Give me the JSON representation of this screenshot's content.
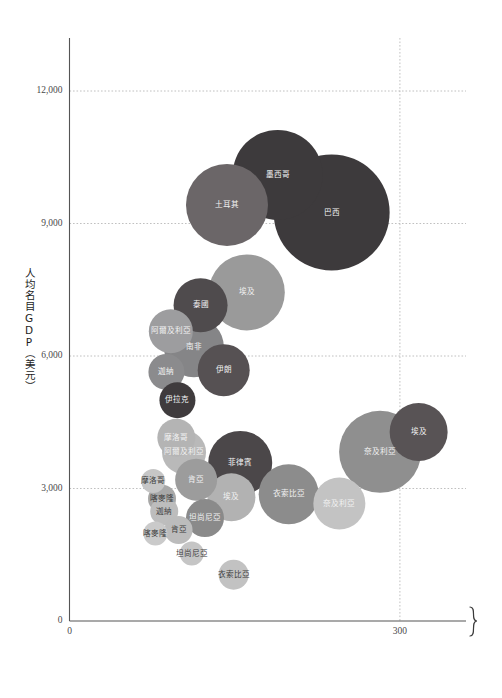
{
  "chart_data": {
    "type": "scatter",
    "title": "",
    "subtitle": "",
    "xlabel": "",
    "ylabel": "人均名目GDP（美元）",
    "xlim": [
      0,
      360
    ],
    "ylim": [
      0,
      13200
    ],
    "xticks": [
      0,
      300
    ],
    "xtick_labels": [
      "0",
      "300"
    ],
    "yticks": [
      0,
      3000,
      6000,
      9000,
      12000
    ],
    "ytick_labels": [
      "0",
      "3,000",
      "6,000",
      "9,000",
      "12,000"
    ],
    "grid": "dotted horizontal and vertical gridlines",
    "legend": "none",
    "axis_break": "curly brace on right end of x-axis indicating truncated axis",
    "bubble_size_meaning": "bubble area encodes a third variable (population / market size)",
    "points": [
      {
        "label": "巴西",
        "x": 238,
        "y": 9250,
        "r": 58,
        "color": "#3d3a3c",
        "text_color": "light"
      },
      {
        "label": "墨西哥",
        "x": 189,
        "y": 10100,
        "r": 45,
        "color": "#3d3a3c",
        "text_color": "light"
      },
      {
        "label": "土耳其",
        "x": 143,
        "y": 9420,
        "r": 41,
        "color": "#6b6668",
        "text_color": "light"
      },
      {
        "label": "埃及",
        "x": 161,
        "y": 7440,
        "r": 38,
        "color": "#9a9a9a",
        "text_color": "light"
      },
      {
        "label": "泰國",
        "x": 119,
        "y": 7150,
        "r": 27,
        "color": "#4f4b4d",
        "text_color": "light"
      },
      {
        "label": "南非",
        "x": 113,
        "y": 6200,
        "r": 30,
        "color": "#858587",
        "text_color": "light"
      },
      {
        "label": "阿爾及利亞",
        "x": 92,
        "y": 6560,
        "r": 22,
        "color": "#9d9d9f",
        "text_color": "light"
      },
      {
        "label": "伊朗",
        "x": 140,
        "y": 5680,
        "r": 26,
        "color": "#565153",
        "text_color": "light"
      },
      {
        "label": "迦納",
        "x": 88,
        "y": 5640,
        "r": 18,
        "color": "#8b8b8d",
        "text_color": "light"
      },
      {
        "label": "伊拉克",
        "x": 98,
        "y": 5000,
        "r": 18,
        "color": "#3f3b3d",
        "text_color": "light"
      },
      {
        "label": "摩洛哥",
        "x": 97,
        "y": 4150,
        "r": 19,
        "color": "#b4b4b4",
        "text_color": "light"
      },
      {
        "label": "阿爾及利亞",
        "x": 104,
        "y": 3820,
        "r": 22,
        "color": "#b9b9b9",
        "text_color": "light"
      },
      {
        "label": "奈及利亞",
        "x": 282,
        "y": 3830,
        "r": 41,
        "color": "#8f8f8f",
        "text_color": "light"
      },
      {
        "label": "埃及",
        "x": 317,
        "y": 4280,
        "r": 29,
        "color": "#585355",
        "text_color": "light"
      },
      {
        "label": "菲律賓",
        "x": 155,
        "y": 3580,
        "r": 32,
        "color": "#4b4749",
        "text_color": "light"
      },
      {
        "label": "肯亞",
        "x": 115,
        "y": 3200,
        "r": 21,
        "color": "#9c9c9c",
        "text_color": "light"
      },
      {
        "label": "摩洛哥",
        "x": 76,
        "y": 3170,
        "r": 12,
        "color": "#c6c6c6",
        "text_color": "dark"
      },
      {
        "label": "衣索比亞",
        "x": 199,
        "y": 2870,
        "r": 30,
        "color": "#8c8c8c",
        "text_color": "light"
      },
      {
        "label": "奈及利亞",
        "x": 245,
        "y": 2660,
        "r": 26,
        "color": "#c3c3c3",
        "text_color": "light"
      },
      {
        "label": "埃及",
        "x": 147,
        "y": 2800,
        "r": 24,
        "color": "#b2b2b2",
        "text_color": "light"
      },
      {
        "label": "喀麥隆",
        "x": 84,
        "y": 2770,
        "r": 14,
        "color": "#a8a8a8",
        "text_color": "dark"
      },
      {
        "label": "迦納",
        "x": 86,
        "y": 2480,
        "r": 14,
        "color": "#bdbdbd",
        "text_color": "dark"
      },
      {
        "label": "坦尚尼亞",
        "x": 123,
        "y": 2330,
        "r": 19,
        "color": "#8a8a8a",
        "text_color": "light"
      },
      {
        "label": "肯亞",
        "x": 99,
        "y": 2060,
        "r": 14,
        "color": "#bcbcbc",
        "text_color": "dark"
      },
      {
        "label": "喀麥隆",
        "x": 78,
        "y": 1980,
        "r": 12,
        "color": "#cacaca",
        "text_color": "dark"
      },
      {
        "label": "坦尚尼亞",
        "x": 111,
        "y": 1530,
        "r": 12,
        "color": "#c5c5c5",
        "text_color": "dark"
      },
      {
        "label": "衣索比亞",
        "x": 149,
        "y": 1050,
        "r": 15,
        "color": "#c2c2c2",
        "text_color": "dark"
      }
    ]
  },
  "axis": {
    "y_title": "人均名目GDP（美元）",
    "x_origin_label": "0",
    "y_origin_label": "0"
  },
  "colors": {
    "background": "#ffffff",
    "axis": "#555555",
    "grid": "#b9b9b9",
    "tick_text": "#4a4a4a"
  }
}
